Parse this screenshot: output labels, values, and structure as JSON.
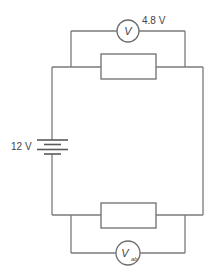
{
  "diagram": {
    "type": "circuit",
    "colors": {
      "wire": "#7a7a7a",
      "text": "#444444",
      "background": "#ffffff"
    },
    "battery": {
      "label": "12 V",
      "icon": "battery-cell-icon"
    },
    "top_voltmeter": {
      "symbol": "V",
      "reading_label": "4.8 V"
    },
    "bottom_voltmeter": {
      "symbol": "V",
      "subscript": "ab"
    },
    "components": [
      {
        "name": "top-resistor",
        "kind": "resistor"
      },
      {
        "name": "bottom-resistor",
        "kind": "resistor"
      },
      {
        "name": "top-voltmeter",
        "kind": "voltmeter",
        "across": "top-resistor"
      },
      {
        "name": "bottom-voltmeter",
        "kind": "voltmeter",
        "across": "bottom-resistor"
      },
      {
        "name": "battery",
        "kind": "cell"
      }
    ]
  }
}
